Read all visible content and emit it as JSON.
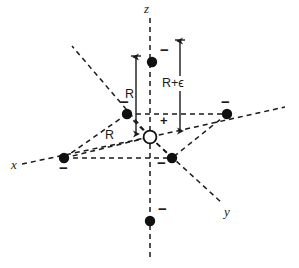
{
  "figure": {
    "type": "octahedral-lattice-diagram",
    "background_color": "#ffffff",
    "line_color": "#1a1a1a",
    "atom_fill": "#111111",
    "central_ion_fill": "#ffffff"
  },
  "axes": [
    {
      "name": "z-axis",
      "label": "z",
      "label_x": 144,
      "label_y": 4
    },
    {
      "name": "x-axis",
      "label": "x",
      "label_x": 11,
      "label_y": 160
    },
    {
      "name": "y-axis",
      "label": "y",
      "label_x": 224,
      "label_y": 207
    }
  ],
  "dimensions": [
    {
      "name": "R",
      "label": "R",
      "label_x": 125,
      "label_y": 90
    },
    {
      "name": "R-diagonal",
      "label": "R",
      "label_x": 108,
      "label_y": 131
    },
    {
      "name": "R-plus-epsilon",
      "label": "R+ϵ",
      "label_x": 162,
      "label_y": 78
    }
  ],
  "charges": {
    "central": "+",
    "ligand": "−"
  },
  "sites": [
    {
      "name": "ligand-top-z",
      "charge": "−",
      "cx": 152,
      "cy": 62,
      "charge_x": 160,
      "charge_y": 49
    },
    {
      "name": "ligand-bottom-z",
      "charge": "−",
      "cx": 150,
      "cy": 221,
      "charge_x": 158,
      "charge_y": 208
    },
    {
      "name": "ligand-upper-left",
      "charge": "−",
      "cx": 127,
      "cy": 114,
      "charge_x": 121,
      "charge_y": 100
    },
    {
      "name": "ligand-right",
      "charge": "−",
      "cx": 227,
      "cy": 114,
      "charge_x": 222,
      "charge_y": 100
    },
    {
      "name": "ligand-far-left-x",
      "charge": "−",
      "cx": 64,
      "cy": 158,
      "charge_x": 60,
      "charge_y": 161
    },
    {
      "name": "ligand-lower-right",
      "charge": "−",
      "cx": 172,
      "cy": 158,
      "charge_x": 160,
      "charge_y": 156
    },
    {
      "name": "central-cation",
      "charge": "+",
      "cx": 150,
      "cy": 137,
      "charge_x": 158,
      "charge_y": 118
    }
  ]
}
